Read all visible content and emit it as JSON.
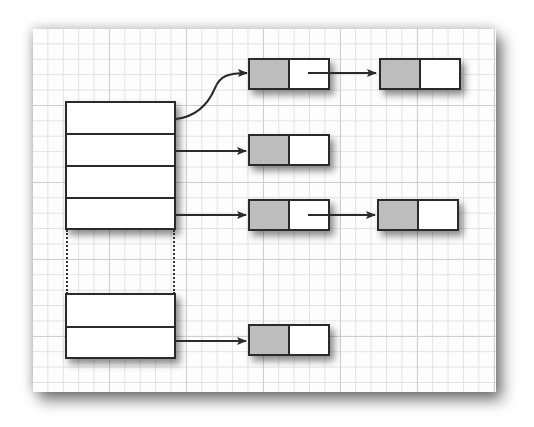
{
  "diagram": {
    "type": "hash-table-with-chaining",
    "background": {
      "style": "graph-paper-grid",
      "minor_grid_color": "#e2e2e2",
      "major_grid_color": "#cfcfcf"
    },
    "colors": {
      "stroke": "#2a2a2a",
      "node_data_fill": "#bdbdbd",
      "node_next_fill": "#ffffff",
      "bucket_fill": "#ffffff"
    },
    "bucket_array": {
      "upper_block_buckets": 4,
      "ellipsis": "dotted-gap",
      "lower_block_buckets": 2
    },
    "chains": [
      {
        "bucket": 0,
        "nodes": 2,
        "arrow_style": "curved"
      },
      {
        "bucket": 1,
        "nodes": 1,
        "arrow_style": "straight"
      },
      {
        "bucket": 2,
        "nodes": 0
      },
      {
        "bucket": 3,
        "nodes": 2,
        "arrow_style": "straight"
      },
      {
        "bucket": "last-1",
        "nodes": 0
      },
      {
        "bucket": "last",
        "nodes": 1,
        "arrow_style": "straight"
      }
    ]
  }
}
